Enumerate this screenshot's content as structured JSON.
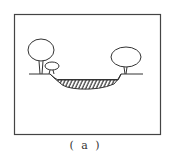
{
  "figure": {
    "caption": "( a )",
    "colors": {
      "stroke": "#333333",
      "background": "#ffffff"
    },
    "elements": [
      {
        "name": "left-large-tree"
      },
      {
        "name": "left-small-shrub"
      },
      {
        "name": "right-tree"
      },
      {
        "name": "hatched-depression"
      },
      {
        "name": "ground-line"
      }
    ]
  }
}
